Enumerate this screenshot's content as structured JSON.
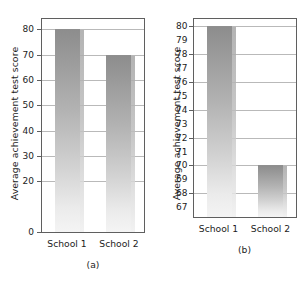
{
  "figure": {
    "background": "#ffffff",
    "bar_top_color": "#8d8d8d",
    "bar_bottom_color": "#f4f4f4",
    "axis_color": "#5f5f5f",
    "grid_color": "#b9b9b9"
  },
  "chart_data": [
    {
      "type": "bar",
      "title": "",
      "caption": "(a)",
      "xlabel": "",
      "ylabel": "Average achievement test score",
      "categories": [
        "School 1",
        "School 2"
      ],
      "values": [
        80,
        70
      ],
      "ylim": [
        0,
        84
      ],
      "yticks": [
        0,
        20,
        30,
        40,
        50,
        60,
        70,
        80
      ],
      "ytick_labels": [
        "0",
        "20",
        "30",
        "40",
        "50",
        "60",
        "70",
        "80"
      ],
      "gridlines": [
        20,
        30,
        40,
        50,
        60,
        70,
        80
      ],
      "grid": true,
      "legend": "none"
    },
    {
      "type": "bar",
      "title": "",
      "caption": "(b)",
      "xlabel": "",
      "ylabel": "Average achievement test score",
      "categories": [
        "School 1",
        "School 2"
      ],
      "values": [
        80,
        70
      ],
      "ylim": [
        66.3,
        80.5
      ],
      "yticks": [
        67,
        68,
        69,
        70,
        71,
        72,
        73,
        74,
        75,
        76,
        77,
        78,
        79,
        80
      ],
      "ytick_labels": [
        "67",
        "68",
        "69",
        "70",
        "71",
        "72",
        "73",
        "74",
        "75",
        "76",
        "77",
        "78",
        "79",
        "80"
      ],
      "gridlines": [
        68,
        70,
        72,
        74,
        76,
        78,
        80
      ],
      "grid": true,
      "legend": "none"
    }
  ]
}
